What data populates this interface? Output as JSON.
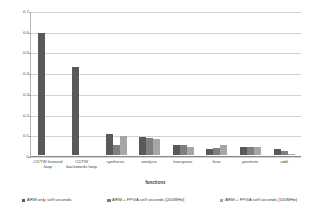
{
  "chart_data": {
    "type": "bar",
    "title": "",
    "xlabel": "functions",
    "ylabel": "time (seconds)",
    "ylim": [
      0,
      0.7
    ],
    "yticks": [
      "0",
      "0.1",
      "0.2",
      "0.3",
      "0.4",
      "0.5",
      "0.6",
      "0.7"
    ],
    "ytick_values": [
      0,
      0.1,
      0.2,
      0.3,
      0.4,
      0.5,
      0.6,
      0.7
    ],
    "grid": "horizontal",
    "legend_position": "bottom",
    "categories": [
      "CDTW forward loop",
      "CDTW backwards loop",
      "synthesis",
      "analysis",
      "transpose",
      "fuse",
      "permute",
      "add"
    ],
    "series": [
      {
        "name": "ARM only self seconds",
        "color": "#595959",
        "values": [
          0.59,
          0.425,
          0.1,
          0.088,
          0.048,
          0.03,
          0.038,
          0.028
        ]
      },
      {
        "name": "ARM + FPGA self seconds [200MHz]",
        "color": "#7f7f7f",
        "values": [
          null,
          null,
          0.05,
          0.083,
          0.048,
          0.033,
          0.038,
          0.018
        ]
      },
      {
        "name": "ARM + FPGA self seconds [100MHz]",
        "color": "#a6a6a6",
        "values": [
          null,
          null,
          0.09,
          0.078,
          0.04,
          0.048,
          0.038,
          0.007
        ]
      }
    ]
  },
  "axes": {
    "y_title": "time (seconds)",
    "x_title": "functions"
  },
  "legend": {
    "items": [
      {
        "label": "ARM only self seconds",
        "color": "#595959"
      },
      {
        "label": "ARM + FPGA self seconds [200MHz]",
        "color": "#7f7f7f"
      },
      {
        "label": "ARM + FPGA self seconds [100MHz]",
        "color": "#a6a6a6"
      }
    ]
  }
}
